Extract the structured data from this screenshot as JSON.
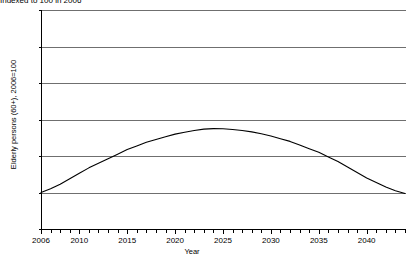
{
  "subtitle": "Indexed to 100 in 2006",
  "chart_data": {
    "type": "line",
    "title": "",
    "subtitle": "Indexed to 100 in 2006",
    "xlabel": "Year",
    "ylabel": "Elderly persons (60+), 2006=100",
    "xlim": [
      2006,
      2044
    ],
    "ylim": [
      80,
      200
    ],
    "yticks": [
      80,
      100,
      120,
      140,
      160,
      180,
      200
    ],
    "xticks": [
      2006,
      2010,
      2015,
      2020,
      2025,
      2030,
      2035,
      2040
    ],
    "xtick_labels": [
      "2006",
      "2010",
      "2015",
      "2020",
      "2025",
      "2030",
      "2035",
      "2040"
    ],
    "ytick_labels": [
      "80",
      "100",
      "120",
      "140",
      "160",
      "180",
      "200"
    ],
    "grid": "horizontal",
    "legend": "none",
    "line_color": "#000000",
    "x": [
      2006,
      2007,
      2008,
      2009,
      2010,
      2011,
      2012,
      2013,
      2014,
      2015,
      2016,
      2017,
      2018,
      2019,
      2020,
      2021,
      2022,
      2023,
      2024,
      2025,
      2026,
      2027,
      2028,
      2029,
      2030,
      2031,
      2032,
      2033,
      2034,
      2035,
      2036,
      2037,
      2038,
      2039,
      2040,
      2041,
      2042,
      2043,
      2044
    ],
    "series": [
      {
        "name": "Elderly persons (60+)",
        "values": [
          100.0,
          102.0,
          104.5,
          107.5,
          110.5,
          113.5,
          116.0,
          118.5,
          121.0,
          123.5,
          125.5,
          127.5,
          129.0,
          130.5,
          132.0,
          133.0,
          134.0,
          134.7,
          135.0,
          134.9,
          134.5,
          134.0,
          133.2,
          132.2,
          131.0,
          129.5,
          128.0,
          126.0,
          124.0,
          122.0,
          119.5,
          117.0,
          114.0,
          111.0,
          108.0,
          105.5,
          103.0,
          101.0,
          99.5
        ]
      }
    ]
  }
}
